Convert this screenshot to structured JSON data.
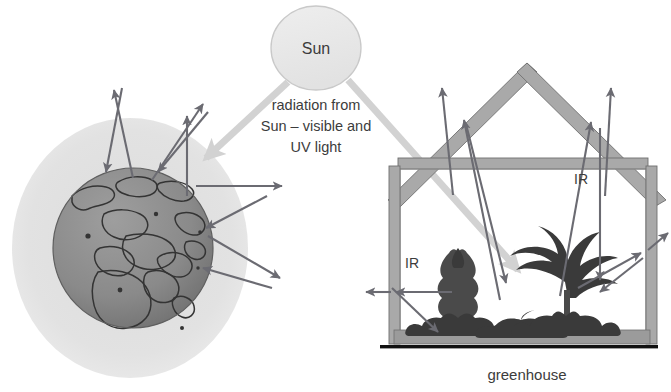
{
  "figure": {
    "type": "diagram",
    "topic": "greenhouse-effect-comparison",
    "labels": {
      "sun": "Sun",
      "radiation_line1": "radiation from",
      "radiation_line2": "Sun – visible and",
      "radiation_line3": "UV light",
      "ir_left": "IR",
      "ir_right": "IR",
      "greenhouse": "greenhouse"
    }
  },
  "colors": {
    "background": "#ffffff",
    "sun_fill": "#e8e8e8",
    "sun_stroke": "#c7c7c7",
    "atmosphere": "#e2e2e2",
    "earth_ocean": "#8a8a8a",
    "earth_land_outline": "#3d3d3d",
    "beam": "#d2d2d2",
    "arrow": "#6b6b72",
    "frame": "#a9a9a9",
    "floor": "#9b9b9b",
    "ground": "#111111",
    "plant": "#4a4a4a",
    "text": "#3c3c3c"
  },
  "earth_panel": {
    "name": "earth-atmosphere-panel",
    "atmosphere": {
      "cx": 130,
      "cy": 248,
      "rx": 118,
      "ry": 130
    },
    "globe": {
      "cx": 133,
      "cy": 248,
      "r": 80
    },
    "arrow_count": 9
  },
  "greenhouse_panel": {
    "name": "greenhouse-panel",
    "roof_apex_x": 527,
    "left_wall_x": 392,
    "right_wall_x": 648,
    "floor_y": 340,
    "ceiling_y": 162,
    "arrow_count": 11
  }
}
